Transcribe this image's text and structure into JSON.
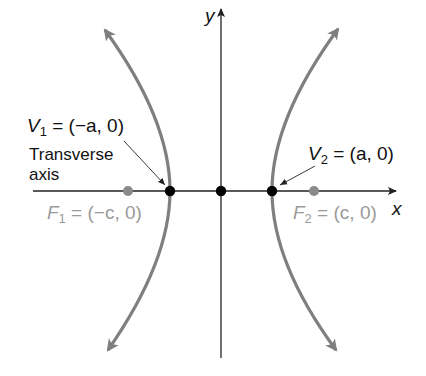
{
  "diagram": {
    "axes": {
      "x_label": "x",
      "y_label": "y"
    },
    "labels": {
      "v1": {
        "name": "V",
        "sub": "1",
        "rest": " = (−a, 0)"
      },
      "v2": {
        "name": "V",
        "sub": "2",
        "rest": " = (a, 0)"
      },
      "f1": {
        "name": "F",
        "sub": "1",
        "rest": " = (−c, 0)"
      },
      "f2": {
        "name": "F",
        "sub": "2",
        "rest": " = (c, 0)"
      },
      "transverse_line1": "Transverse",
      "transverse_line2": "axis"
    },
    "points": [
      {
        "name": "V1",
        "x": 170,
        "y": 191,
        "color": "#000000"
      },
      {
        "name": "origin",
        "x": 221,
        "y": 191,
        "color": "#000000"
      },
      {
        "name": "V2",
        "x": 272,
        "y": 191,
        "color": "#000000"
      },
      {
        "name": "F1",
        "x": 128,
        "y": 191,
        "color": "#8a8a8a"
      },
      {
        "name": "F2",
        "x": 314,
        "y": 191,
        "color": "#8a8a8a"
      }
    ],
    "colors": {
      "curve": "#7f7f7f",
      "axis": "#222222",
      "focus": "#8a8a8a",
      "vertex": "#000000"
    }
  }
}
